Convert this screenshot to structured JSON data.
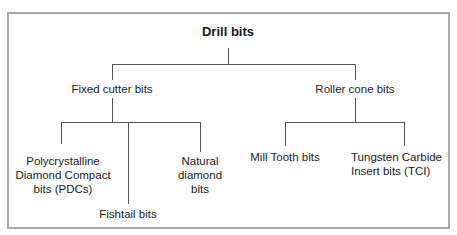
{
  "diagram": {
    "type": "tree",
    "root": {
      "label": "Drill bits"
    },
    "branches": [
      {
        "label": "Fixed cutter bits",
        "children": [
          {
            "label_lines": [
              "Polycrystalline",
              "Diamond Compact",
              "bits (PDCs)"
            ]
          },
          {
            "label_lines": [
              "Fishtail bits"
            ]
          },
          {
            "label_lines": [
              "Natural",
              "diamond",
              "bits"
            ]
          }
        ]
      },
      {
        "label": "Roller cone bits",
        "children": [
          {
            "label_lines": [
              "Mill Tooth bits"
            ]
          },
          {
            "label_lines": [
              "Tungsten Carbide",
              "Insert bits (TCI)"
            ]
          }
        ]
      }
    ],
    "colors": {
      "frame": "#a9a9a9",
      "lines": "#555555",
      "text": "#1a1a1a"
    }
  }
}
